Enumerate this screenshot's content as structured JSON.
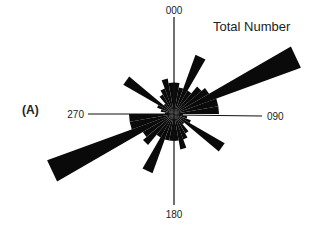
{
  "chart_data": {
    "type": "rose",
    "title": "Total Number",
    "panel_label": "(A)",
    "bin_width_deg": 10,
    "direction_labels": [
      {
        "angle": 0,
        "label": "000"
      },
      {
        "angle": 90,
        "label": "090"
      },
      {
        "angle": 180,
        "label": "180"
      },
      {
        "angle": 270,
        "label": "270"
      }
    ],
    "axis_extent": 28,
    "bins": [
      {
        "from": 0,
        "to": 10,
        "value": 7
      },
      {
        "from": 10,
        "to": 20,
        "value": 6
      },
      {
        "from": 20,
        "to": 30,
        "value": 14
      },
      {
        "from": 30,
        "to": 40,
        "value": 6
      },
      {
        "from": 40,
        "to": 50,
        "value": 8
      },
      {
        "from": 50,
        "to": 60,
        "value": 9
      },
      {
        "from": 60,
        "to": 70,
        "value": 30
      },
      {
        "from": 70,
        "to": 80,
        "value": 10
      },
      {
        "from": 80,
        "to": 90,
        "value": 10
      },
      {
        "from": 90,
        "to": 100,
        "value": 2
      },
      {
        "from": 100,
        "to": 110,
        "value": 3
      },
      {
        "from": 110,
        "to": 120,
        "value": 4
      },
      {
        "from": 120,
        "to": 130,
        "value": 13
      },
      {
        "from": 130,
        "to": 140,
        "value": 3
      },
      {
        "from": 140,
        "to": 150,
        "value": 5
      },
      {
        "from": 150,
        "to": 160,
        "value": 6
      },
      {
        "from": 160,
        "to": 170,
        "value": 8
      },
      {
        "from": 170,
        "to": 180,
        "value": 6
      },
      {
        "from": 180,
        "to": 190,
        "value": 6
      },
      {
        "from": 190,
        "to": 200,
        "value": 6
      },
      {
        "from": 200,
        "to": 210,
        "value": 14
      },
      {
        "from": 210,
        "to": 220,
        "value": 6
      },
      {
        "from": 220,
        "to": 230,
        "value": 9
      },
      {
        "from": 230,
        "to": 240,
        "value": 8
      },
      {
        "from": 240,
        "to": 250,
        "value": 30
      },
      {
        "from": 250,
        "to": 260,
        "value": 10
      },
      {
        "from": 260,
        "to": 270,
        "value": 10
      },
      {
        "from": 270,
        "to": 280,
        "value": 2
      },
      {
        "from": 280,
        "to": 290,
        "value": 3
      },
      {
        "from": 290,
        "to": 300,
        "value": 4
      },
      {
        "from": 300,
        "to": 310,
        "value": 13
      },
      {
        "from": 310,
        "to": 320,
        "value": 3
      },
      {
        "from": 320,
        "to": 330,
        "value": 5
      },
      {
        "from": 330,
        "to": 340,
        "value": 6
      },
      {
        "from": 340,
        "to": 350,
        "value": 8
      },
      {
        "from": 350,
        "to": 360,
        "value": 7
      }
    ]
  }
}
